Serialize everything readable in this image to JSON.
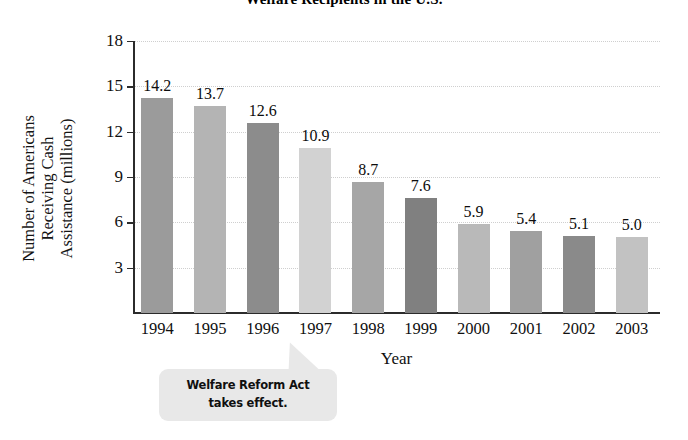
{
  "chart_data": {
    "type": "bar",
    "title": "Welfare Recipients in the U.S.",
    "xlabel": "Year",
    "ylabel": "Number of Americans Receiving Cash Assistance (millions)",
    "ylabel_lines": [
      "Number of Americans",
      "Receiving Cash",
      "Assistance (millions)"
    ],
    "categories": [
      "1994",
      "1995",
      "1996",
      "1997",
      "1998",
      "1999",
      "2000",
      "2001",
      "2002",
      "2003"
    ],
    "values": [
      14.2,
      13.7,
      12.6,
      10.9,
      8.7,
      7.6,
      5.9,
      5.4,
      5.1,
      5.0
    ],
    "value_labels": [
      "14.2",
      "13.7",
      "12.6",
      "10.9",
      "8.7",
      "7.6",
      "5.9",
      "5.4",
      "5.1",
      "5.0"
    ],
    "bar_colors": [
      "#9b9b9b",
      "#b4b4b4",
      "#8c8c8c",
      "#d2d2d2",
      "#a6a6a6",
      "#808080",
      "#b9b9b9",
      "#a0a0a0",
      "#8a8a8a",
      "#c2c2c2"
    ],
    "ylim": [
      0,
      18
    ],
    "yticks": [
      3,
      6,
      9,
      12,
      15,
      18
    ],
    "ytick_labels": [
      "3",
      "6",
      "9",
      "12",
      "15",
      "18"
    ],
    "grid": true,
    "grid_style": "dotted",
    "legend": null,
    "annotations": [
      {
        "name": "welfare-reform-act-callout",
        "lines": [
          "Welfare Reform Act",
          "takes effect."
        ],
        "text": "Welfare Reform Act takes effect.",
        "points_to": "1997",
        "background": "#e8e8e8"
      }
    ],
    "axis_color": "#2b2b2b",
    "grid_color": "#cfcfcf",
    "background": "#ffffff"
  }
}
